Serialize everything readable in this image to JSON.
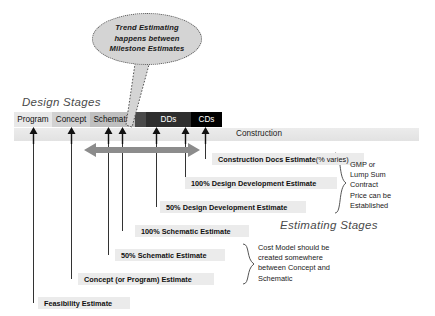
{
  "bubble": {
    "lines": [
      "Trend Estimating",
      "happens between",
      "Milestone Estimates"
    ],
    "shape": "ellipse-callout"
  },
  "headings": {
    "design_stages": "Design Stages",
    "estimating_stages": "Estimating Stages"
  },
  "stage_bar": {
    "segments": [
      {
        "label": "Program",
        "x": 0,
        "w": 38,
        "bg": "#e8e8e8",
        "fg": "#111111"
      },
      {
        "label": "Concept",
        "x": 38,
        "w": 38,
        "bg": "#d2d2d2",
        "fg": "#111111"
      },
      {
        "label": "Schematic",
        "x": 76,
        "w": 45,
        "bg": "#bfbfbf",
        "fg": "#111111"
      },
      {
        "label": "",
        "x": 121,
        "w": 11,
        "bg": "#4a4a4a",
        "fg": "#ffffff"
      },
      {
        "label": "DDs",
        "x": 132,
        "w": 45,
        "bg": "#2e2e2e",
        "fg": "#ffffff"
      },
      {
        "label": "CDs",
        "x": 177,
        "w": 31,
        "bg": "#000000",
        "fg": "#ffffff"
      }
    ]
  },
  "construction": {
    "label": "Construction"
  },
  "span_arrow": {
    "color": "#8c8c8c",
    "direction": "double-horizontal"
  },
  "milestone_arrows": [
    {
      "x": 33
    },
    {
      "x": 71
    },
    {
      "x": 108
    },
    {
      "x": 122
    },
    {
      "x": 156
    },
    {
      "x": 185
    },
    {
      "x": 205
    }
  ],
  "estimates": [
    {
      "name": "construction-docs-estimate",
      "label": "Construction Docs Estimate ",
      "suffix": "(% varies)",
      "x": 212,
      "y": 153,
      "w": 140,
      "tick_x": 205
    },
    {
      "name": "dd-100-estimate",
      "label": "100% Design Development Estimate",
      "suffix": "",
      "x": 185,
      "y": 177,
      "w": 140,
      "tick_x": 185
    },
    {
      "name": "dd-50-estimate",
      "label": "50% Design Development Estimate",
      "suffix": "",
      "x": 160,
      "y": 201,
      "w": 134,
      "tick_x": 156
    },
    {
      "name": "schematic-100-estimate",
      "label": "100% Schematic Estimate",
      "suffix": "",
      "x": 135,
      "y": 225,
      "w": 102,
      "tick_x": 122
    },
    {
      "name": "schematic-50-estimate",
      "label": "50% Schematic Estimate",
      "suffix": "",
      "x": 115,
      "y": 249,
      "w": 98,
      "tick_x": 108
    },
    {
      "name": "concept-program-estimate",
      "label": "Concept (or Program) Estimate",
      "suffix": "",
      "x": 78,
      "y": 273,
      "w": 124,
      "tick_x": 71
    },
    {
      "name": "feasibility-estimate",
      "label": "Feasibility Estimate",
      "suffix": "",
      "x": 38,
      "y": 297,
      "w": 80,
      "tick_x": 33
    }
  ],
  "notes": {
    "gmp": [
      "GMP or",
      "Lump Sum",
      "Contract",
      "Price can be",
      "Established"
    ],
    "cost_model": [
      "Cost Model should be",
      "created somewhere",
      "between Concept and",
      "Schematic"
    ]
  },
  "colors": {
    "chip_bg": "#ebebeb",
    "band_bg": "#e7e7e7",
    "bubble_bg": "#d4d4d4",
    "arrow_grey": "#8c8c8c",
    "ink": "#1a1a1a"
  }
}
